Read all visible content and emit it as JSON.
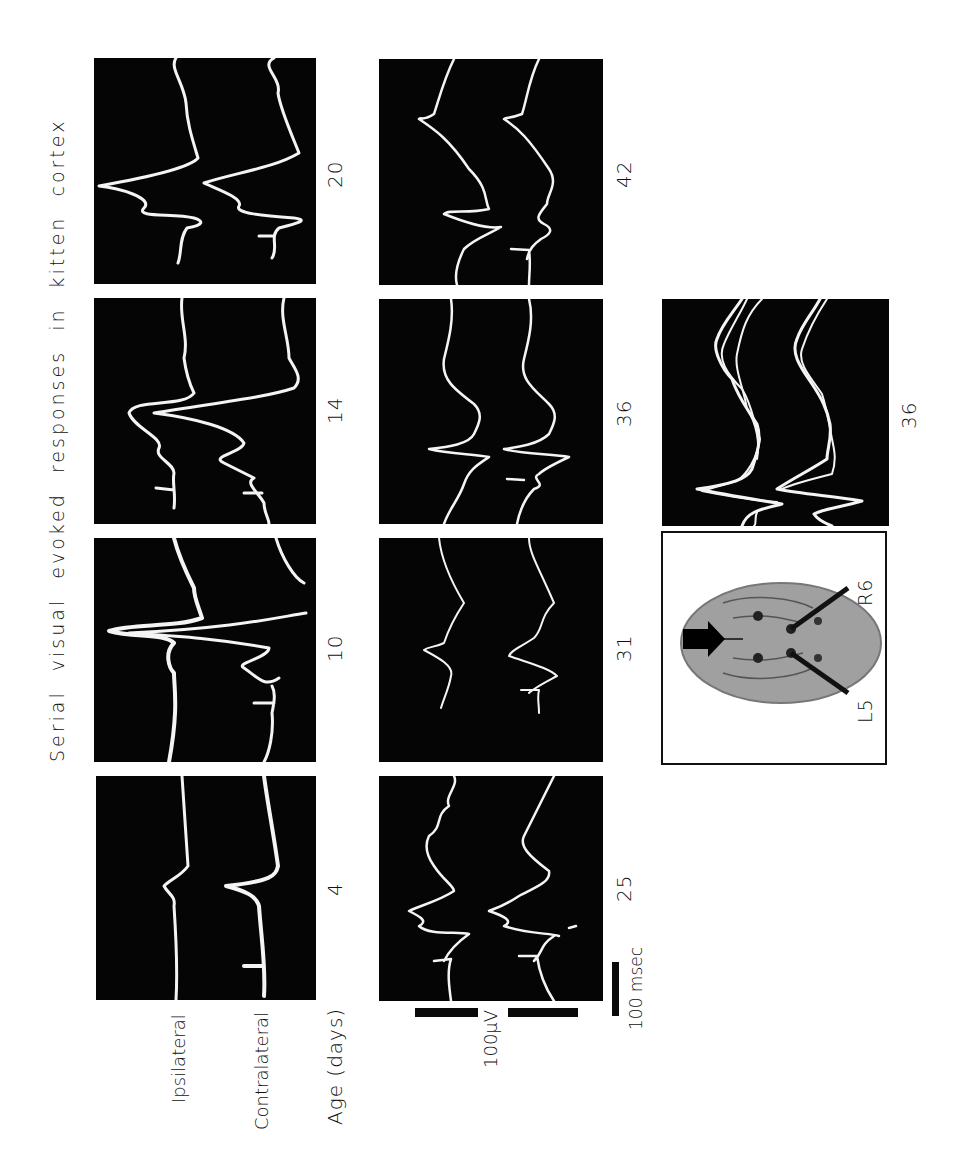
{
  "figure": {
    "title": "Serial visual evoked responses in kitten cortex",
    "row_labels": {
      "ipsilateral": "Ipsilateral",
      "contralateral": "Contralateral"
    },
    "age_axis_label": "Age (days)",
    "panels": [
      {
        "age": "4",
        "column": 1,
        "row": 4
      },
      {
        "age": "10",
        "column": 1,
        "row": 3
      },
      {
        "age": "14",
        "column": 1,
        "row": 2
      },
      {
        "age": "20",
        "column": 1,
        "row": 1
      },
      {
        "age": "25",
        "column": 2,
        "row": 4
      },
      {
        "age": "31",
        "column": 2,
        "row": 3
      },
      {
        "age": "36",
        "column": 2,
        "row": 2
      },
      {
        "age": "42",
        "column": 2,
        "row": 1
      },
      {
        "age": "36",
        "column": 3,
        "row": 2,
        "note": "superimposed traces"
      }
    ],
    "labels": {
      "p4": "4",
      "p10": "10",
      "p14": "14",
      "p20": "20",
      "p25": "25",
      "p31": "31",
      "p36": "36",
      "p42": "42",
      "p36b": "36"
    },
    "scale_bars": {
      "voltage": "100μV",
      "time": "100 msec"
    },
    "brain_diagram": {
      "electrode_left": "L5",
      "electrode_right": "R6",
      "arrow": "stimulus-direction-arrow"
    },
    "colors": {
      "panel_bg": "#050505",
      "trace": "#f4f4f4",
      "page_bg": "#ffffff",
      "brain": "#9a9a9a"
    }
  }
}
